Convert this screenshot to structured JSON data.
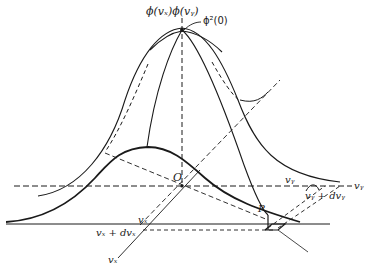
{
  "figure": {
    "colors": {
      "ink": "#1a1a1a",
      "shade": "#d4d4d4",
      "background": "#ffffff"
    }
  },
  "labels": {
    "top_product": "ϕ(vₓ)ϕ(vᵧ)",
    "peak": "ϕ²(0)",
    "origin": "O",
    "point": "P",
    "vy_axis": "vᵧ",
    "vy_near": "vᵧ",
    "vy_plus_dvy": "vᵧ + dvᵧ",
    "vx_near": "vₓ",
    "vx_plus_dvx": "vₓ + dvₓ",
    "vx_axis": "vₓ"
  }
}
